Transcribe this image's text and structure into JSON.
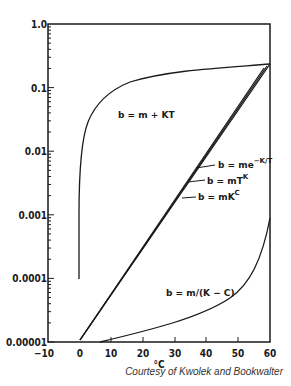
{
  "chart_data": {
    "type": "line",
    "title": "",
    "xlabel": "°C",
    "ylabel": "",
    "xlim": [
      -10,
      60
    ],
    "ylim": [
      1e-05,
      1.0
    ],
    "yscale": "log",
    "grid": false,
    "legend": "inline labels",
    "x_ticks": [
      "-10",
      "0",
      "10",
      "20",
      "30",
      "40",
      "50",
      "60"
    ],
    "y_ticks": [
      "1.0",
      "0.1",
      "0.01",
      "0.001",
      "0.0001",
      "0.00001"
    ],
    "series": [
      {
        "name": "b = m + KT",
        "x": [
          0,
          0,
          0.5,
          1,
          3,
          6,
          12,
          20,
          35,
          60
        ],
        "y": [
          0.0001,
          0.001,
          0.003,
          0.008,
          0.02,
          0.04,
          0.1,
          0.13,
          0.16,
          0.23
        ]
      },
      {
        "name": "b = me^-K/T",
        "x": [
          0,
          60
        ],
        "y": [
          1e-05,
          0.23
        ]
      },
      {
        "name": "b = mT^K",
        "x": [
          0,
          60
        ],
        "y": [
          1e-05,
          0.23
        ]
      },
      {
        "name": "b = mK^C",
        "x": [
          0,
          60
        ],
        "y": [
          1e-05,
          0.23
        ]
      },
      {
        "name": "b = m/(K - C)",
        "x": [
          6,
          19,
          31,
          44,
          50,
          55,
          58,
          60
        ],
        "y": [
          1e-05,
          1.4e-05,
          2e-05,
          4e-05,
          7e-05,
          0.00014,
          0.00032,
          0.0009
        ]
      }
    ],
    "annotations": [
      "b = m + KT",
      "b = me^-K/T",
      "b = mT^K",
      "b = mK^C",
      "b = m/(K - C)"
    ]
  },
  "labels": {
    "x_axis_title": "°C",
    "credit": "Courtesy of Kwolek and Bookwalter",
    "curve_mkt": "b = m + KT",
    "curve_exp": "b = me",
    "curve_exp_sup": "−K/T",
    "curve_pow": "b = mT",
    "curve_pow_sup": "K",
    "curve_kc": "b = mK",
    "curve_kc_sup": "C",
    "curve_inv": "b = m/(K − C)"
  },
  "ticks": {
    "y": [
      {
        "label": "1.0",
        "py": 24
      },
      {
        "label": "0.1",
        "py": 88
      },
      {
        "label": "0.01",
        "py": 151
      },
      {
        "label": "0.001",
        "py": 215
      },
      {
        "label": "0.0001",
        "py": 278
      },
      {
        "label": "0.00001",
        "py": 342
      }
    ],
    "x": [
      {
        "label": "−10",
        "px": 48
      },
      {
        "label": "0",
        "px": 80
      },
      {
        "label": "10",
        "px": 111
      },
      {
        "label": "20",
        "px": 143
      },
      {
        "label": "30",
        "px": 175
      },
      {
        "label": "40",
        "px": 206
      },
      {
        "label": "50",
        "px": 238
      },
      {
        "label": "60",
        "px": 270
      }
    ]
  }
}
